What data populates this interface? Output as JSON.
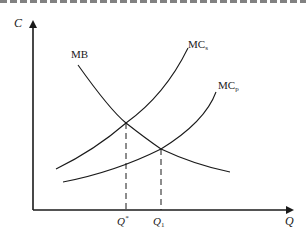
{
  "diagram": {
    "type": "economics-externality-diagram",
    "axes": {
      "y_label": "C",
      "x_label": "Q"
    },
    "curves": [
      {
        "id": "mb",
        "label": "MB",
        "description": "marginal benefit (downward sloping)"
      },
      {
        "id": "mcs",
        "label_main": "MC",
        "label_sub": "s",
        "description": "marginal social cost"
      },
      {
        "id": "mcp",
        "label_main": "MC",
        "label_sub": "p",
        "description": "marginal private cost"
      }
    ],
    "equilibria": [
      {
        "id": "social-optimum",
        "label_main": "Q",
        "label_sup": "*",
        "intersection": "MB ∩ MCs"
      },
      {
        "id": "private-market",
        "label_main": "Q",
        "label_sub": "1",
        "intersection": "MB ∩ MCp"
      }
    ],
    "colors": {
      "ink": "#1a1a1a",
      "background": "#ffffff"
    }
  }
}
